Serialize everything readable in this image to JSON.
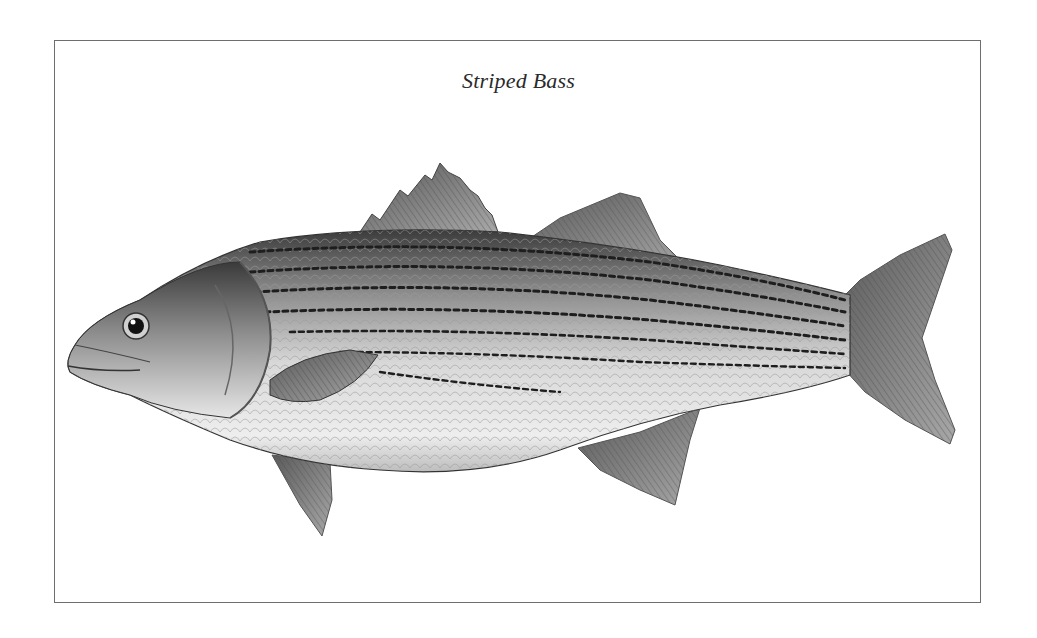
{
  "title": "Striped Bass",
  "illustration": {
    "subject": "striped bass fish",
    "style": "grayscale pencil illustration",
    "colors": {
      "border": "#6e6e6e",
      "stripe": "#1e1e1e",
      "body_light": "#e2e2e2",
      "body_dark": "#4a4a4a",
      "fin": "#7a7a7a"
    }
  }
}
